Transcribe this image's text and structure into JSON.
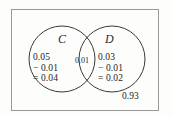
{
  "diagram": {
    "frame": {
      "stroke_color": "#9a9a9a",
      "background_color": "#fdfdfc"
    },
    "circles": {
      "stroke_color": "#3a3a3a",
      "left": {
        "cx": 62,
        "cy": 59,
        "r": 33,
        "label": "C"
      },
      "right": {
        "cx": 112,
        "cy": 59,
        "r": 33,
        "label": "D"
      }
    },
    "labels": {
      "set_c": "C",
      "set_d": "D",
      "intersection": "0.01",
      "outside": "0.93"
    },
    "regions": {
      "c_only": {
        "line1": "0.05",
        "line2_op": "−",
        "line2_val": "0.01",
        "line3_op": "=",
        "line3_val": "0.04"
      },
      "d_only": {
        "line1": "0.03",
        "line2_op": "−",
        "line2_val": "0.01",
        "line3_op": "=",
        "line3_val": "0.02"
      }
    }
  }
}
